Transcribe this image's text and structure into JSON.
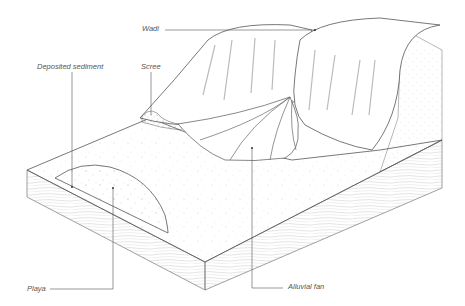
{
  "diagram": {
    "labels": [
      {
        "id": "wadi",
        "text": "Wadi"
      },
      {
        "id": "deposited-sediment",
        "text": "Deposited sediment"
      },
      {
        "id": "scree",
        "text": "Scree"
      },
      {
        "id": "playa",
        "text": "Playa"
      },
      {
        "id": "alluvial-fan",
        "text": "Alluvial fan"
      }
    ]
  }
}
